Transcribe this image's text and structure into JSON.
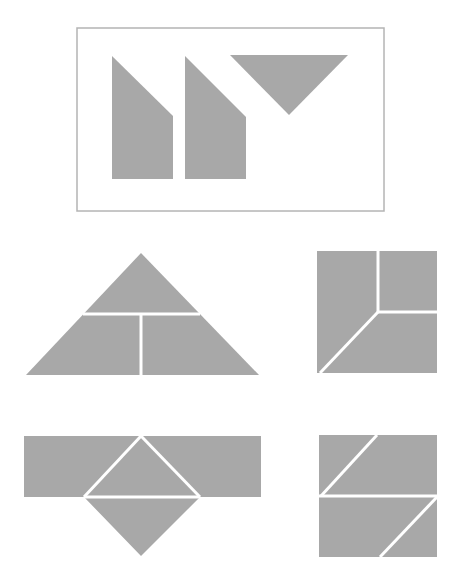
{
  "colors": {
    "piece_fill": "#a8a8a8",
    "frame_stroke": "#b4b4b4",
    "background": "#ffffff",
    "gap": "#ffffff"
  },
  "frame": {
    "x": 77,
    "y": 28,
    "w": 307,
    "h": 183
  },
  "given_pieces": [
    {
      "name": "trapezoid-piece-1",
      "points": "112,56 173,116 173,179 112,179"
    },
    {
      "name": "trapezoid-piece-2",
      "points": "185,56 246,117 246,179 185,179"
    },
    {
      "name": "triangle-piece",
      "points": "230,55 348,55 289,115"
    }
  ],
  "options": [
    {
      "name": "option-large-triangle",
      "shape": "26,375 141,253 259,375",
      "cuts": [
        "83,314 200,314",
        "141,314 141,375"
      ]
    },
    {
      "name": "option-square-a",
      "shape": "317,251 437,251 437,373 317,373",
      "cuts": [
        "378,251 378,312",
        "378,312 437,312",
        "378,312 320,373"
      ]
    },
    {
      "name": "option-rect-with-diamond",
      "shape": "24,436 261,436 261,497 200,497 141,556 84,497 24,497",
      "cuts": [
        "141,436 84,497",
        "141,436 200,497",
        "84,497 200,497"
      ]
    },
    {
      "name": "option-square-b",
      "shape": "319,435 437,435 437,557 319,557",
      "cuts": [
        "319,496 437,496",
        "377,435 321,496",
        "437,497 380,557"
      ]
    }
  ]
}
